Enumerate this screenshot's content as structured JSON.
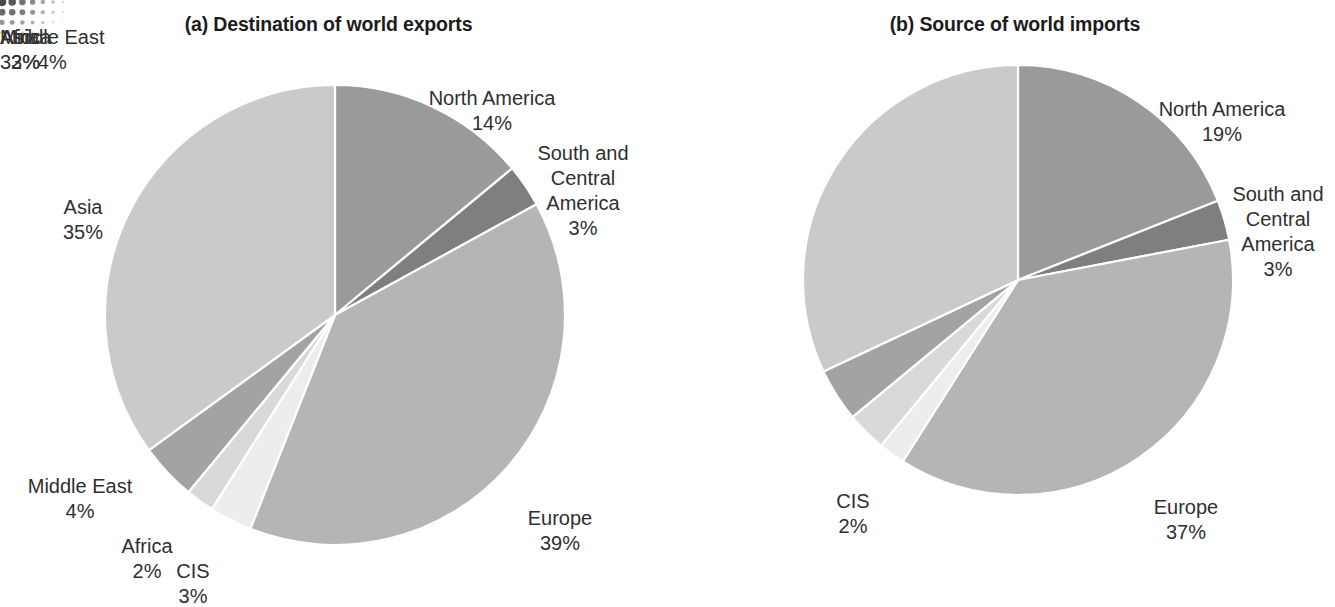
{
  "figure": {
    "background": "#ffffff",
    "decor": {
      "name": "halftone-dot-corner",
      "color": "#4a4a4a"
    }
  },
  "palette": {
    "north_america": "#9a9a9a",
    "south_central_america": "#7f7f7f",
    "europe": "#b5b5b5",
    "cis": "#ededed",
    "africa": "#d9d9d9",
    "middle_east": "#a3a3a3",
    "asia": "#cacaca",
    "separator": "#ffffff",
    "text": "#2f2f2f",
    "title_text": "#1c1c1c"
  },
  "chart_data": [
    {
      "type": "pie",
      "id": "destination-of-world-exports",
      "title": "(a) Destination of world exports",
      "xlabel": "",
      "ylabel": "",
      "legend": "none",
      "labels_position": "outside-callout",
      "units": "percent",
      "start_angle_deg": 0,
      "direction": "clockwise",
      "categories": [
        "North America",
        "South and Central America",
        "Europe",
        "CIS",
        "Africa",
        "Middle East",
        "Asia"
      ],
      "values": [
        14,
        3,
        39,
        3,
        2,
        4,
        35
      ],
      "slices": [
        {
          "label": "North America",
          "label_display": "North America",
          "value": 14,
          "value_text": "14%",
          "color": "#9a9a9a"
        },
        {
          "label": "South and Central America",
          "label_display": "South and\nCentral\nAmerica",
          "value": 3,
          "value_text": "3%",
          "color": "#7f7f7f"
        },
        {
          "label": "Europe",
          "label_display": "Europe",
          "value": 39,
          "value_text": "39%",
          "color": "#b5b5b5"
        },
        {
          "label": "CIS",
          "label_display": "CIS",
          "value": 3,
          "value_text": "3%",
          "color": "#ededed"
        },
        {
          "label": "Africa",
          "label_display": "Africa",
          "value": 2,
          "value_text": "2%",
          "color": "#d9d9d9"
        },
        {
          "label": "Middle East",
          "label_display": "Middle East",
          "value": 4,
          "value_text": "4%",
          "color": "#a3a3a3"
        },
        {
          "label": "Asia",
          "label_display": "Asia",
          "value": 35,
          "value_text": "35%",
          "color": "#cacaca"
        }
      ]
    },
    {
      "type": "pie",
      "id": "source-of-world-imports",
      "title": "(b) Source of world imports",
      "xlabel": "",
      "ylabel": "",
      "legend": "none",
      "labels_position": "outside-callout",
      "units": "percent",
      "start_angle_deg": 0,
      "direction": "clockwise",
      "categories": [
        "North America",
        "South and Central America",
        "Europe",
        "CIS",
        "Africa",
        "Middle East",
        "Asia"
      ],
      "values": [
        19,
        3,
        37,
        2,
        3,
        4,
        32
      ],
      "slices": [
        {
          "label": "North America",
          "label_display": "North America",
          "value": 19,
          "value_text": "19%",
          "color": "#9a9a9a"
        },
        {
          "label": "South and Central America",
          "label_display": "South and\nCentral\nAmerica",
          "value": 3,
          "value_text": "3%",
          "color": "#7f7f7f"
        },
        {
          "label": "Europe",
          "label_display": "Europe",
          "value": 37,
          "value_text": "37%",
          "color": "#b5b5b5"
        },
        {
          "label": "CIS",
          "label_display": "CIS",
          "value": 2,
          "value_text": "2%",
          "color": "#ededed"
        },
        {
          "label": "Africa",
          "label_display": "Africa",
          "value": 3,
          "value_text": "3%",
          "color": "#d9d9d9"
        },
        {
          "label": "Middle East",
          "label_display": "Middle East",
          "value": 4,
          "value_text": "4%",
          "color": "#a3a3a3"
        },
        {
          "label": "Asia",
          "label_display": "Asia",
          "value": 32,
          "value_text": "32%",
          "color": "#cacaca"
        }
      ]
    }
  ],
  "geometry": [
    {
      "cx": 335,
      "cy": 315,
      "r": 230
    },
    {
      "cx": 1018,
      "cy": 280,
      "r": 215
    }
  ]
}
